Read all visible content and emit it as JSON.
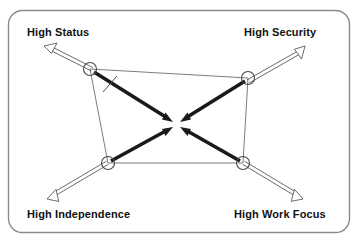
{
  "diagram": {
    "type": "force-field-convergence-diagram",
    "frame": {
      "shape": "rounded-rectangle",
      "stroke_color": "#8a8a8a"
    },
    "colors": {
      "outline_arrow": "#5a5a5a",
      "thick_arrow": "#1a1a1a",
      "quad_edge": "#6e6e6e",
      "node_circle": "#4a4a4a",
      "label_text": "#111111"
    },
    "nodes": [
      {
        "id": "high-status",
        "label": "High Status",
        "label_position": "top-left",
        "node_x": 90,
        "node_y": 69,
        "outward_arrow_tip_x": 44,
        "outward_arrow_tip_y": 46,
        "outward_arrow_style": "hollow-double-line"
      },
      {
        "id": "high-security",
        "label": "High Security",
        "label_position": "top-right",
        "node_x": 248,
        "node_y": 78,
        "outward_arrow_tip_x": 305,
        "outward_arrow_tip_y": 46,
        "outward_arrow_style": "hollow-double-line"
      },
      {
        "id": "high-independence",
        "label": "High Independence",
        "label_position": "bottom-left",
        "node_x": 108,
        "node_y": 163,
        "outward_arrow_tip_x": 47,
        "outward_arrow_tip_y": 199,
        "outward_arrow_style": "hollow-double-line"
      },
      {
        "id": "high-work-focus",
        "label": "High Work Focus",
        "label_position": "bottom-right",
        "node_x": 243,
        "node_y": 163,
        "outward_arrow_tip_x": 303,
        "outward_arrow_tip_y": 199,
        "outward_arrow_style": "hollow-double-line"
      }
    ],
    "center": {
      "x": 176,
      "y": 124
    },
    "convergence_arrows": [
      {
        "from": "high-status",
        "to": "center",
        "style": "thick-solid-black"
      },
      {
        "from": "high-security",
        "to": "center",
        "style": "thick-solid-black"
      },
      {
        "from": "high-independence",
        "to": "center",
        "style": "thick-solid-black"
      },
      {
        "from": "high-work-focus",
        "to": "center",
        "style": "thick-solid-black"
      }
    ],
    "quad_edges": [
      {
        "from": "high-status",
        "to": "high-security"
      },
      {
        "from": "high-security",
        "to": "high-work-focus"
      },
      {
        "from": "high-work-focus",
        "to": "high-independence"
      },
      {
        "from": "high-independence",
        "to": "high-status"
      }
    ],
    "tick_mark": {
      "x": 110,
      "y": 84,
      "description": "small slash crossing upper-left thick arrow"
    }
  }
}
